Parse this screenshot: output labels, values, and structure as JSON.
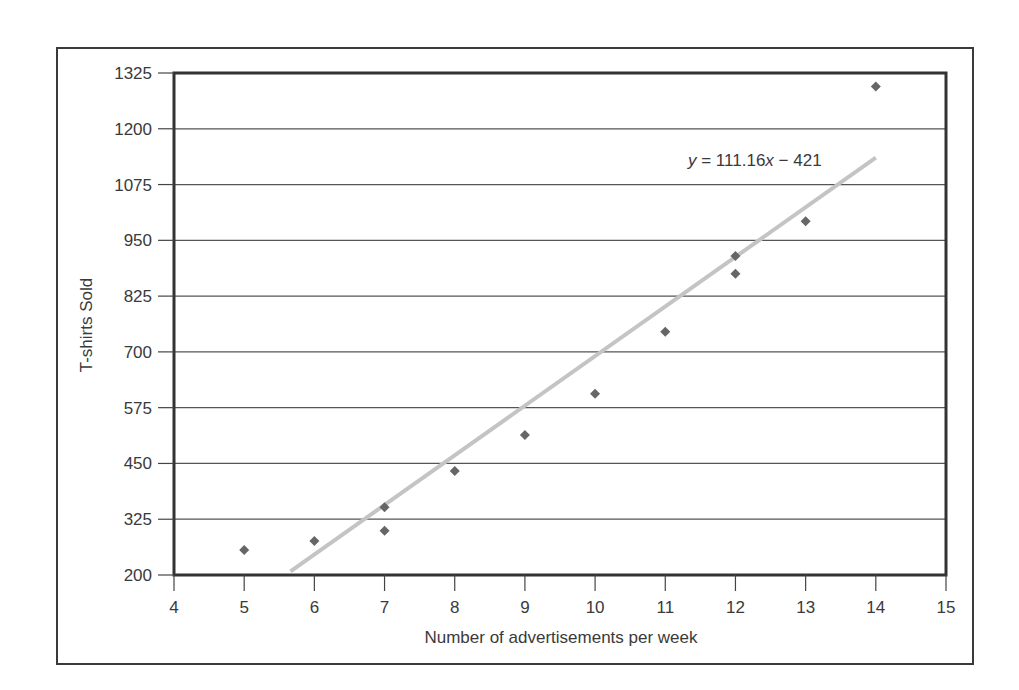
{
  "chart_data": {
    "type": "scatter",
    "title": "",
    "xlabel": "Number of advertisements per week",
    "ylabel": "T-shirts Sold",
    "xlim": [
      4,
      15
    ],
    "ylim": [
      200,
      1325
    ],
    "x_ticks": [
      4,
      5,
      6,
      7,
      8,
      9,
      10,
      11,
      12,
      13,
      14,
      15
    ],
    "y_ticks": [
      200,
      325,
      450,
      575,
      700,
      825,
      950,
      1075,
      1200,
      1325
    ],
    "grid": {
      "horizontal": true,
      "vertical": false
    },
    "legend": null,
    "series": [
      {
        "name": "T-shirts Sold",
        "marker": "diamond",
        "color": "#666666",
        "points": [
          {
            "x": 5,
            "y": 256
          },
          {
            "x": 6,
            "y": 276
          },
          {
            "x": 7,
            "y": 352
          },
          {
            "x": 7,
            "y": 299
          },
          {
            "x": 8,
            "y": 433
          },
          {
            "x": 9,
            "y": 514
          },
          {
            "x": 10,
            "y": 606
          },
          {
            "x": 11,
            "y": 745
          },
          {
            "x": 12,
            "y": 915
          },
          {
            "x": 12,
            "y": 875
          },
          {
            "x": 13,
            "y": 993
          },
          {
            "x": 14,
            "y": 1295
          }
        ]
      }
    ],
    "trendline": {
      "type": "linear",
      "slope": 111.16,
      "intercept": -421,
      "x_start": 5.66,
      "x_end": 14,
      "color": "#c4c4c4",
      "equation_label": {
        "prefix": "y",
        "middle": " = 111.16",
        "var": "x",
        "suffix": " − 421"
      }
    }
  },
  "colors": {
    "frame": "#3a3a3a",
    "plot_border": "#333333",
    "gridline": "#555555",
    "marker": "#666666",
    "trendline": "#c4c4c4",
    "text": "#3a3a3a"
  }
}
